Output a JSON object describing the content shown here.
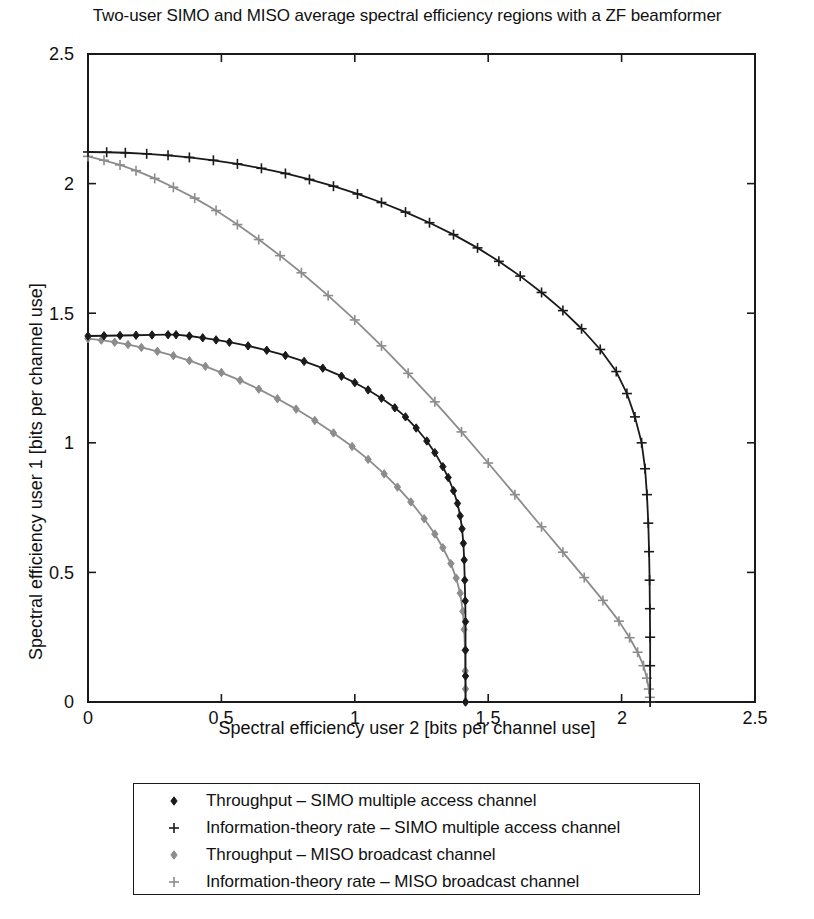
{
  "chart_data": {
    "type": "line",
    "title": "Two-user SIMO and MISO average spectral efficiency regions with a ZF beamformer",
    "xlabel": "Spectral efficiency user 2 [bits per channel use]",
    "ylabel": "Spectral efficiency user 1 [bits per channel use]",
    "xlim": [
      0,
      2.5
    ],
    "ylim": [
      0,
      2.5
    ],
    "xticks": [
      "0",
      "0.5",
      "1",
      "1.5",
      "2",
      "2.5"
    ],
    "yticks": [
      "0",
      "0.5",
      "1",
      "1.5",
      "2",
      "2.5"
    ],
    "xtick_values": [
      0,
      0.5,
      1,
      1.5,
      2,
      2.5
    ],
    "ytick_values": [
      0,
      0.5,
      1,
      1.5,
      2,
      2.5
    ],
    "grid": false,
    "legend_position": "below-axes",
    "series": [
      {
        "name": "Throughput – SIMO multiple access channel",
        "color": "#1a1a1a",
        "marker": "diamond",
        "points": [
          [
            0.0,
            1.412
          ],
          [
            0.06,
            1.413
          ],
          [
            0.12,
            1.414
          ],
          [
            0.18,
            1.415
          ],
          [
            0.24,
            1.416
          ],
          [
            0.3,
            1.417
          ],
          [
            0.33,
            1.417
          ],
          [
            0.38,
            1.412
          ],
          [
            0.43,
            1.405
          ],
          [
            0.48,
            1.397
          ],
          [
            0.53,
            1.388
          ],
          [
            0.6,
            1.374
          ],
          [
            0.67,
            1.357
          ],
          [
            0.74,
            1.337
          ],
          [
            0.81,
            1.314
          ],
          [
            0.88,
            1.288
          ],
          [
            0.95,
            1.257
          ],
          [
            1.0,
            1.232
          ],
          [
            1.05,
            1.204
          ],
          [
            1.1,
            1.172
          ],
          [
            1.15,
            1.135
          ],
          [
            1.19,
            1.1
          ],
          [
            1.23,
            1.057
          ],
          [
            1.27,
            1.007
          ],
          [
            1.3,
            0.962
          ],
          [
            1.33,
            0.908
          ],
          [
            1.35,
            0.866
          ],
          [
            1.37,
            0.815
          ],
          [
            1.385,
            0.766
          ],
          [
            1.395,
            0.718
          ],
          [
            1.402,
            0.668
          ],
          [
            1.407,
            0.612
          ],
          [
            1.41,
            0.548
          ],
          [
            1.412,
            0.47
          ],
          [
            1.414,
            0.39
          ],
          [
            1.415,
            0.31
          ],
          [
            1.415,
            0.2
          ],
          [
            1.415,
            0.1
          ],
          [
            1.415,
            0.0
          ]
        ]
      },
      {
        "name": "Information-theory rate – SIMO multiple access channel",
        "color": "#1a1a1a",
        "marker": "plus",
        "points": [
          [
            0.0,
            2.122
          ],
          [
            0.07,
            2.121
          ],
          [
            0.14,
            2.119
          ],
          [
            0.22,
            2.115
          ],
          [
            0.3,
            2.109
          ],
          [
            0.38,
            2.101
          ],
          [
            0.47,
            2.09
          ],
          [
            0.56,
            2.076
          ],
          [
            0.65,
            2.059
          ],
          [
            0.74,
            2.039
          ],
          [
            0.83,
            2.016
          ],
          [
            0.92,
            1.99
          ],
          [
            1.01,
            1.96
          ],
          [
            1.1,
            1.927
          ],
          [
            1.19,
            1.89
          ],
          [
            1.28,
            1.849
          ],
          [
            1.37,
            1.803
          ],
          [
            1.46,
            1.752
          ],
          [
            1.54,
            1.7
          ],
          [
            1.62,
            1.643
          ],
          [
            1.7,
            1.58
          ],
          [
            1.78,
            1.51
          ],
          [
            1.85,
            1.44
          ],
          [
            1.92,
            1.36
          ],
          [
            1.98,
            1.275
          ],
          [
            2.02,
            1.19
          ],
          [
            2.05,
            1.1
          ],
          [
            2.075,
            1.0
          ],
          [
            2.088,
            0.9
          ],
          [
            2.095,
            0.8
          ],
          [
            2.1,
            0.69
          ],
          [
            2.103,
            0.58
          ],
          [
            2.105,
            0.47
          ],
          [
            2.106,
            0.36
          ],
          [
            2.107,
            0.25
          ],
          [
            2.107,
            0.14
          ],
          [
            2.107,
            0.0
          ]
        ]
      },
      {
        "name": "Throughput – MISO broadcast channel",
        "color": "#8c8c8c",
        "marker": "diamond",
        "points": [
          [
            0.0,
            1.402
          ],
          [
            0.05,
            1.396
          ],
          [
            0.1,
            1.388
          ],
          [
            0.15,
            1.379
          ],
          [
            0.2,
            1.368
          ],
          [
            0.26,
            1.353
          ],
          [
            0.32,
            1.336
          ],
          [
            0.38,
            1.317
          ],
          [
            0.44,
            1.295
          ],
          [
            0.5,
            1.271
          ],
          [
            0.57,
            1.241
          ],
          [
            0.64,
            1.207
          ],
          [
            0.71,
            1.17
          ],
          [
            0.78,
            1.13
          ],
          [
            0.85,
            1.086
          ],
          [
            0.92,
            1.038
          ],
          [
            0.99,
            0.986
          ],
          [
            1.05,
            0.936
          ],
          [
            1.11,
            0.88
          ],
          [
            1.16,
            0.829
          ],
          [
            1.21,
            0.772
          ],
          [
            1.26,
            0.707
          ],
          [
            1.3,
            0.648
          ],
          [
            1.33,
            0.595
          ],
          [
            1.36,
            0.534
          ],
          [
            1.38,
            0.478
          ],
          [
            1.395,
            0.42
          ],
          [
            1.405,
            0.35
          ],
          [
            1.41,
            0.28
          ],
          [
            1.413,
            0.2
          ],
          [
            1.414,
            0.12
          ],
          [
            1.415,
            0.05
          ],
          [
            1.415,
            0.0
          ]
        ]
      },
      {
        "name": "Information-theory rate – MISO broadcast channel",
        "color": "#8c8c8c",
        "marker": "plus",
        "points": [
          [
            0.0,
            2.105
          ],
          [
            0.06,
            2.09
          ],
          [
            0.12,
            2.072
          ],
          [
            0.18,
            2.05
          ],
          [
            0.25,
            2.02
          ],
          [
            0.32,
            1.986
          ],
          [
            0.4,
            1.944
          ],
          [
            0.48,
            1.896
          ],
          [
            0.56,
            1.842
          ],
          [
            0.64,
            1.784
          ],
          [
            0.72,
            1.722
          ],
          [
            0.8,
            1.656
          ],
          [
            0.9,
            1.568
          ],
          [
            1.0,
            1.474
          ],
          [
            1.1,
            1.374
          ],
          [
            1.2,
            1.268
          ],
          [
            1.3,
            1.158
          ],
          [
            1.4,
            1.042
          ],
          [
            1.5,
            0.922
          ],
          [
            1.6,
            0.8
          ],
          [
            1.7,
            0.676
          ],
          [
            1.78,
            0.578
          ],
          [
            1.86,
            0.48
          ],
          [
            1.93,
            0.392
          ],
          [
            1.99,
            0.312
          ],
          [
            2.03,
            0.248
          ],
          [
            2.06,
            0.192
          ],
          [
            2.082,
            0.14
          ],
          [
            2.095,
            0.092
          ],
          [
            2.102,
            0.05
          ],
          [
            2.106,
            0.018
          ],
          [
            2.107,
            0.0
          ]
        ]
      }
    ]
  },
  "legend": {
    "entries": [
      "Throughput – SIMO multiple access channel",
      "Information-theory rate – SIMO multiple access channel",
      "Throughput – MISO broadcast channel",
      "Information-theory rate – MISO broadcast channel"
    ]
  },
  "axes": {
    "x_tick_0": "0",
    "x_tick_1": "0.5",
    "x_tick_2": "1",
    "x_tick_3": "1.5",
    "x_tick_4": "2",
    "x_tick_5": "2.5",
    "y_tick_0": "0",
    "y_tick_1": "0.5",
    "y_tick_2": "1",
    "y_tick_3": "1.5",
    "y_tick_4": "2",
    "y_tick_5": "2.5"
  },
  "colors": {
    "simo": "#1a1a1a",
    "miso": "#8c8c8c",
    "axis": "#1a1a1a",
    "background": "#ffffff"
  }
}
